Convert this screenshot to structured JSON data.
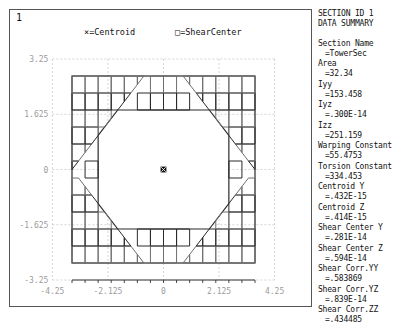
{
  "window": {
    "id_label": "1"
  },
  "legend": {
    "centroid": {
      "marker": "x-marker-icon",
      "glyph": "×",
      "text": "=Centroid"
    },
    "shear_center": {
      "marker": "square-marker-icon",
      "glyph": "□",
      "text": "=ShearCenter"
    }
  },
  "summary": {
    "title_line1": "SECTION ID 1",
    "title_line2": "DATA SUMMARY",
    "entries": [
      {
        "label": "Section Name",
        "value": "=TowerSec"
      },
      {
        "label": "Area",
        "value": "=32.34"
      },
      {
        "label": "Iyy",
        "value": "=153.458"
      },
      {
        "label": "Iyz",
        "value": "=.300E-14"
      },
      {
        "label": "Izz",
        "value": "=251.159"
      },
      {
        "label": "Warping Constant",
        "value": "=55.4753"
      },
      {
        "label": "Torsion Constant",
        "value": "=334.453"
      },
      {
        "label": "Centroid Y",
        "value": "=.432E-15"
      },
      {
        "label": "Centroid Z",
        "value": "=.414E-15"
      },
      {
        "label": "Shear Center Y",
        "value": "=.281E-14"
      },
      {
        "label": "Shear Center Z",
        "value": "=.594E-14"
      },
      {
        "label": "Shear Corr.YY",
        "value": "=.583869"
      },
      {
        "label": "Shear Corr.YZ",
        "value": "=.839E-14"
      },
      {
        "label": "Shear Corr.ZZ",
        "value": "=.434485"
      }
    ]
  },
  "chart_data": {
    "type": "mesh",
    "title": "",
    "xlabel": "",
    "ylabel": "",
    "xlim": [
      -4.25,
      4.25
    ],
    "ylim": [
      -3.25,
      3.25
    ],
    "xticks": [
      -4.25,
      -2.125,
      0,
      2.125,
      4.25
    ],
    "xtick_labels": [
      "-4.25",
      "-2.125",
      "0",
      "2.125",
      "4.25"
    ],
    "yticks": [
      -3.25,
      -1.625,
      0,
      1.625,
      3.25
    ],
    "ytick_labels": [
      "-3.25",
      "-1.625",
      "0",
      "1.625",
      "3.25"
    ],
    "grid": true,
    "grid_style": "dashed",
    "legend_position": "top",
    "section_name": "TowerSec",
    "outline": {
      "description": "hollow rectangular box section with chamfered inner corners",
      "outer": {
        "half_width": 3.5,
        "half_height": 2.75
      },
      "inner": {
        "half_width": 2.5,
        "half_height": 1.75,
        "chamfer": 0.75
      }
    },
    "mesh": {
      "outer_x_divisions": [
        -3.5,
        -3.0,
        -2.5,
        -2.0,
        -1.5,
        -1.0,
        -0.5,
        0.0,
        0.5,
        1.0,
        1.5,
        2.0,
        2.5,
        3.0,
        3.5
      ],
      "outer_y_divisions": [
        -2.75,
        -2.25,
        -1.75,
        -1.25,
        -0.75,
        -0.25,
        0.25,
        0.75,
        1.25,
        1.75,
        2.25,
        2.75
      ],
      "wall_layers": 2
    },
    "markers": [
      {
        "name": "centroid",
        "glyph": "×",
        "x": 0,
        "y": 0
      },
      {
        "name": "shear-center",
        "glyph": "□",
        "x": 0,
        "y": 0
      }
    ]
  }
}
